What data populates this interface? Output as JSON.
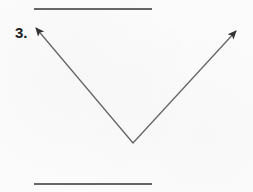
{
  "problem": {
    "number_label": "3.",
    "figure": {
      "type": "angle",
      "description": "Two rays from a common vertex forming a V shape",
      "vertex": {
        "x": 133,
        "y": 143
      },
      "ray_left_end": {
        "x": 35,
        "y": 27
      },
      "ray_right_end": {
        "x": 237,
        "y": 30
      },
      "stroke_color": "#666666"
    },
    "answer_lines": [
      {
        "position": "top",
        "value": ""
      },
      {
        "position": "bottom",
        "value": ""
      }
    ]
  }
}
